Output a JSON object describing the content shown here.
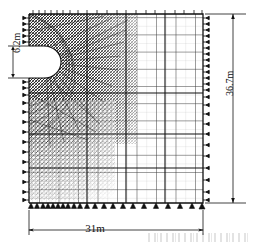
{
  "figure": {
    "type": "finite-element-mesh-diagram",
    "background_color": "#ffffff",
    "line_color": "#1a1a1a",
    "domain": {
      "width_label": "31m",
      "height_label": "36.7m",
      "width_value": 31,
      "height_value": 36.7,
      "unit": "m"
    },
    "cavity": {
      "shape": "D-shaped half-opening on left boundary",
      "height_label": "6.2m",
      "height_value": 6.2,
      "unit": "m"
    },
    "mesh": {
      "refined_zone": "dense triangular elements near cavity",
      "far_field_zone": "coarse rectangular grid",
      "gridlines_horizontal": 22,
      "gridlines_vertical": 20
    },
    "boundary_conditions": {
      "left_edge": "roller supports (horizontal restraint)",
      "right_edge": "roller supports (horizontal restraint)",
      "bottom_edge": "pinned triangular supports",
      "top_edge": "free / tick marks"
    }
  },
  "dimensions": {
    "width": "31m",
    "height": "36.7m",
    "cavity_height": "6.2m"
  }
}
